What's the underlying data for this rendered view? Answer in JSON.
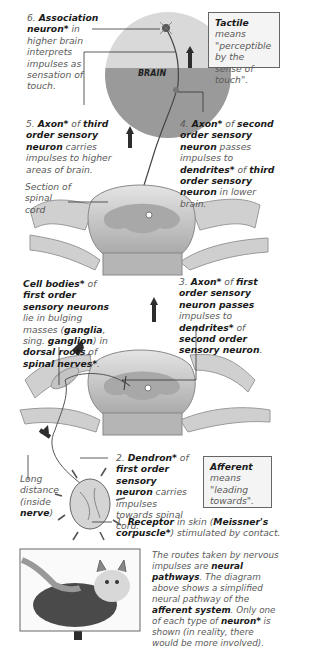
{
  "labels": {
    "step6": {
      "num": "6.",
      "bold1": "Association neuron*",
      "rest": " in higher brain interprets impulses as sensation of touch."
    },
    "step5": {
      "num": "5.",
      "bold1": "Axon*",
      "mid1": " of ",
      "bold2": "third order sensory neuron",
      "rest": " carries impulses to higher areas of brain."
    },
    "step4": {
      "num": "4.",
      "bold1": "Axon*",
      "mid1": " of ",
      "bold2": "second order sensory neuron",
      "mid2": " passes impulses to ",
      "bold3": "dendrites*",
      "mid3": " of ",
      "bold4": "third order sensory neuron",
      "rest": " in lower brain."
    },
    "step3": {
      "num": "3.",
      "bold1": "Axon*",
      "mid1": " of ",
      "bold2": "first order sensory neuron passes",
      "mid2": " impulses to ",
      "bold3": "dendrites*",
      "mid3": " of ",
      "bold4": "second order sensory neuron",
      "rest": "."
    },
    "step2": {
      "num": "2.",
      "bold1": "Dendron*",
      "mid1": " of ",
      "bold2": "first order sensory neuron",
      "rest": " carries impulses towards spinal cord."
    },
    "step1": {
      "num": "1.",
      "bold1": "Receptor",
      "mid1": " in skin (",
      "bold2": "Meissner's corpuscle*",
      "rest": ") stimulated by contact."
    },
    "cell_bodies": {
      "bold1": "Cell bodies*",
      "mid1": " of ",
      "bold2": "first order sensory neurons",
      "mid2": " lie in bulging masses (",
      "bold3": "ganglia",
      "mid3": ", sing. ",
      "bold4": "ganglion",
      "mid4": ") in ",
      "bold5": "dorsal roots",
      "mid5": " of ",
      "bold6": "spinal nerves*",
      "rest": "."
    },
    "section": "Section of spinal cord",
    "long_distance": {
      "pre": "Long distance (inside ",
      "bold1": "nerve",
      "rest": ")"
    },
    "brain": "BRAIN"
  },
  "boxes": {
    "tactile": {
      "bold1": "Tactile",
      "rest": " means \"perceptible by the sense of touch\"."
    },
    "afferent": {
      "bold1": "Afferent",
      "rest": " means \"leading towards\"."
    }
  },
  "caption": {
    "p1": "The routes taken by nervous impulses are ",
    "b1": "neural pathways",
    "p2": ". The diagram above shows a simplified neural pathway of the ",
    "b2": "afferent system",
    "p3": ". Only one of each type of ",
    "b3": "neuron*",
    "p4": " is shown (in reality, there would be more involved)."
  },
  "colors": {
    "brain_top": "#d9d9d9",
    "brain_bottom": "#9a9a9a",
    "cord": "#c8c8c8",
    "grey_matter": "#a8a8a8",
    "arrow": "#2d2d2d"
  }
}
